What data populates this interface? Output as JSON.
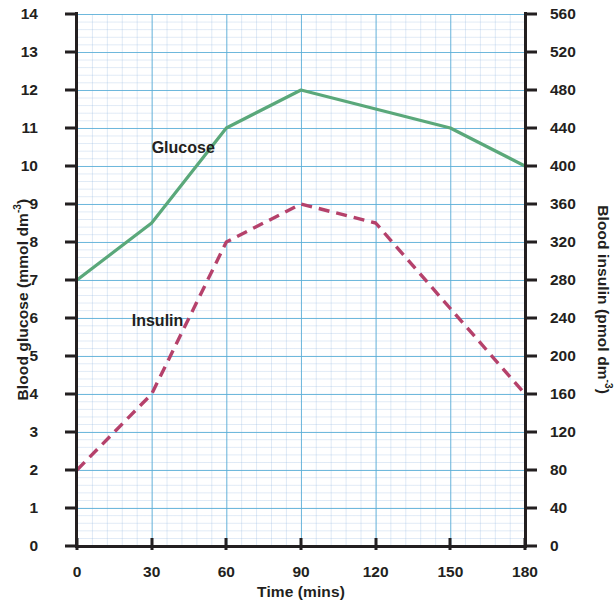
{
  "chart_data": {
    "type": "line",
    "title": "",
    "xlabel": "Time (mins)",
    "ylabel": "Blood glucose (mmol dm-3)",
    "ylabel_right": "Blood insulin (pmol dm-3)",
    "x": [
      0,
      30,
      60,
      90,
      120,
      150,
      180
    ],
    "xlim": [
      0,
      180
    ],
    "xticks": [
      "0",
      "30",
      "60",
      "90",
      "120",
      "150",
      "180"
    ],
    "ylim": [
      0,
      14
    ],
    "yticks": [
      "0",
      "1",
      "2",
      "3",
      "4",
      "5",
      "6",
      "7",
      "8",
      "9",
      "10",
      "11",
      "12",
      "13",
      "14"
    ],
    "ylim_right": [
      0,
      560
    ],
    "yticks_right": [
      "0",
      "40",
      "80",
      "120",
      "160",
      "200",
      "240",
      "280",
      "320",
      "360",
      "400",
      "440",
      "480",
      "520",
      "560"
    ],
    "grid": true,
    "legend_position": "inline-annotations",
    "series": [
      {
        "name": "Glucose",
        "axis": "left",
        "units": "mmol dm-3",
        "color": "#5aa87a",
        "style": "solid",
        "values": [
          7,
          8.5,
          11,
          12,
          11.5,
          11,
          10
        ]
      },
      {
        "name": "Insulin",
        "axis": "right",
        "units": "pmol dm-3",
        "color": "#b5416b",
        "style": "dashed",
        "values_left_scale": [
          2,
          4,
          8,
          9,
          8.5,
          6.25,
          4
        ],
        "values": [
          80,
          160,
          320,
          360,
          340,
          250,
          160
        ]
      }
    ],
    "annotations": [
      {
        "text": "Glucose",
        "x": 30,
        "y": 10.45
      },
      {
        "text": "Insulin",
        "x": 22,
        "y": 5.9
      }
    ]
  },
  "labels": {
    "y_left_main": "Blood glucose (mmol dm",
    "y_left_sup": "-3",
    "y_left_tail": ")",
    "y_right_main": "Blood insulin (pmol dm",
    "y_right_sup": "-3",
    "y_right_tail": ")",
    "x_axis": "Time (mins)",
    "series_glucose": "Glucose",
    "series_insulin": "Insulin"
  }
}
